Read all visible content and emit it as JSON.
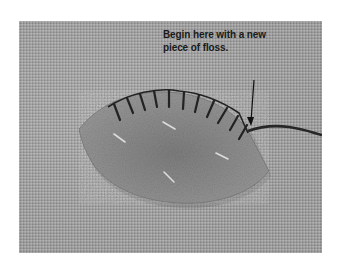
{
  "figure": {
    "annotation": {
      "line1": "Begin here with a new",
      "line2": "piece of floss.",
      "pointer": "down-arrow-icon"
    },
    "colors": {
      "background": "#ffffff",
      "fabric": "#a9a9a9",
      "felt_leaf": "#8f8f8f",
      "stitch_floss": "#222222",
      "pins": "#d8d8d8",
      "text": "#1a1a1a"
    }
  }
}
